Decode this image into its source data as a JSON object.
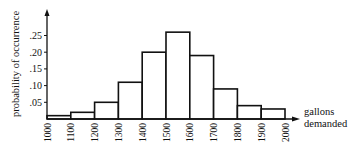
{
  "chart_data": {
    "type": "bar",
    "title": "",
    "xlabel": "gallons demanded",
    "xlabel_lines": [
      "gallons",
      "demanded"
    ],
    "ylabel": "probability of occurrence",
    "x_ticks": [
      "1000",
      "1100",
      "1200",
      "1300",
      "1400",
      "1500",
      "1600",
      "1700",
      "1800",
      "1900",
      "2000"
    ],
    "y_ticks": [
      ".05",
      ".10",
      ".15",
      ".20",
      ".25"
    ],
    "y_tick_values": [
      0.05,
      0.1,
      0.15,
      0.2,
      0.25
    ],
    "categories": [
      "1000-1100",
      "1100-1200",
      "1200-1300",
      "1300-1400",
      "1400-1500",
      "1500-1600",
      "1600-1700",
      "1700-1800",
      "1800-1900",
      "1900-2000"
    ],
    "bin_edges": [
      1000,
      1100,
      1200,
      1300,
      1400,
      1500,
      1600,
      1700,
      1800,
      1900,
      2000
    ],
    "values": [
      0.01,
      0.02,
      0.05,
      0.11,
      0.2,
      0.26,
      0.19,
      0.09,
      0.04,
      0.03
    ],
    "ylim": [
      0,
      0.29
    ],
    "xlim": [
      1000,
      2000
    ],
    "grid": false,
    "legend": null,
    "style": {
      "bar_fill": "#ffffff",
      "bar_stroke": "#111111",
      "axis_color": "#111111"
    }
  }
}
